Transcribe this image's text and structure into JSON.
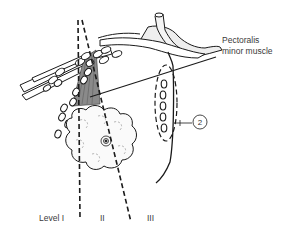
{
  "figure": {
    "labels": {
      "muscle": [
        "Pectoralis",
        "minor muscle"
      ],
      "level_1": "Level I",
      "level_2": "II",
      "level_3": "III",
      "callout": "2"
    },
    "colors": {
      "line": "#1a1a1a",
      "muscle_fill": "#8a8a8a",
      "background": "#ffffff"
    }
  }
}
